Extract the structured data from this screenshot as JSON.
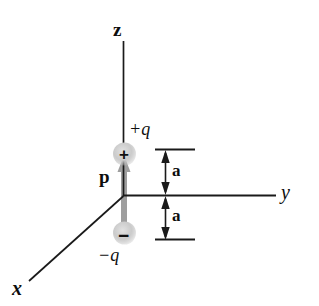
{
  "figure": {
    "background_color": "#ffffff",
    "axis_color": "#1a1a1a",
    "dipole_arrow_color": "#9e9e9e",
    "charge_fill_color": "#c9c9c9"
  },
  "axes": {
    "z_label": "z",
    "y_label": "y",
    "x_label": "x"
  },
  "charges": {
    "positive": {
      "label": "+q",
      "sign": "+"
    },
    "negative": {
      "label": "−q",
      "sign": "−"
    }
  },
  "vector": {
    "label": "p"
  },
  "dimensions": {
    "upper_label": "a",
    "lower_label": "a"
  }
}
